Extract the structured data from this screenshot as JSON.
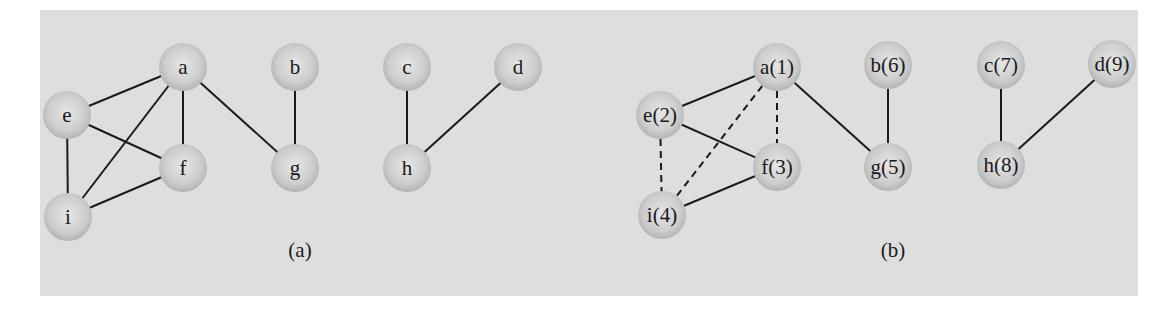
{
  "figure": {
    "background_color": "#dedede",
    "node_fill_center": "#e6e6e6",
    "node_fill_edge": "#b4b4b4",
    "edge_color": "#1a1a1a",
    "node_radius": 24
  },
  "graphs": [
    {
      "id": "a",
      "caption": "(a)",
      "caption_pos": [
        300,
        257
      ],
      "nodes": [
        {
          "id": "a",
          "label": "a",
          "x": 183,
          "y": 67
        },
        {
          "id": "b",
          "label": "b",
          "x": 295,
          "y": 67
        },
        {
          "id": "c",
          "label": "c",
          "x": 407,
          "y": 67
        },
        {
          "id": "d",
          "label": "d",
          "x": 518,
          "y": 67
        },
        {
          "id": "e",
          "label": "e",
          "x": 67,
          "y": 115
        },
        {
          "id": "f",
          "label": "f",
          "x": 183,
          "y": 168
        },
        {
          "id": "g",
          "label": "g",
          "x": 295,
          "y": 168
        },
        {
          "id": "h",
          "label": "h",
          "x": 407,
          "y": 168
        },
        {
          "id": "i",
          "label": "i",
          "x": 68,
          "y": 217
        }
      ],
      "edges": [
        {
          "from": "a",
          "to": "e",
          "style": "solid"
        },
        {
          "from": "a",
          "to": "i",
          "style": "solid"
        },
        {
          "from": "a",
          "to": "f",
          "style": "solid"
        },
        {
          "from": "a",
          "to": "g",
          "style": "solid"
        },
        {
          "from": "e",
          "to": "f",
          "style": "solid"
        },
        {
          "from": "e",
          "to": "i",
          "style": "solid"
        },
        {
          "from": "i",
          "to": "f",
          "style": "solid"
        },
        {
          "from": "b",
          "to": "g",
          "style": "solid"
        },
        {
          "from": "c",
          "to": "h",
          "style": "solid"
        },
        {
          "from": "h",
          "to": "d",
          "style": "solid"
        }
      ]
    },
    {
      "id": "b",
      "caption": "(b)",
      "caption_pos": [
        893,
        257
      ],
      "nodes": [
        {
          "id": "a",
          "label": "a(1)",
          "x": 777,
          "y": 67
        },
        {
          "id": "b",
          "label": "b(6)",
          "x": 888,
          "y": 65
        },
        {
          "id": "c",
          "label": "c(7)",
          "x": 1001,
          "y": 65
        },
        {
          "id": "d",
          "label": "d(9)",
          "x": 1112,
          "y": 64
        },
        {
          "id": "e",
          "label": "e(2)",
          "x": 660,
          "y": 115
        },
        {
          "id": "f",
          "label": "f(3)",
          "x": 777,
          "y": 167
        },
        {
          "id": "g",
          "label": "g(5)",
          "x": 888,
          "y": 167
        },
        {
          "id": "h",
          "label": "h(8)",
          "x": 1001,
          "y": 165
        },
        {
          "id": "i",
          "label": "i(4)",
          "x": 662,
          "y": 215
        }
      ],
      "edges": [
        {
          "from": "a",
          "to": "e",
          "style": "solid"
        },
        {
          "from": "a",
          "to": "i",
          "style": "dashed"
        },
        {
          "from": "a",
          "to": "f",
          "style": "dashed"
        },
        {
          "from": "a",
          "to": "g",
          "style": "solid"
        },
        {
          "from": "e",
          "to": "f",
          "style": "solid"
        },
        {
          "from": "e",
          "to": "i",
          "style": "dashed"
        },
        {
          "from": "i",
          "to": "f",
          "style": "solid"
        },
        {
          "from": "b",
          "to": "g",
          "style": "solid"
        },
        {
          "from": "c",
          "to": "h",
          "style": "solid"
        },
        {
          "from": "h",
          "to": "d",
          "style": "solid"
        }
      ]
    }
  ]
}
